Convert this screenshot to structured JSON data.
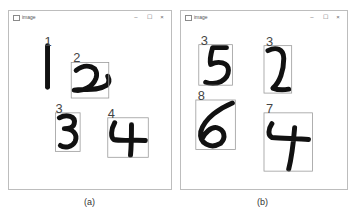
{
  "windows": [
    {
      "id": "a",
      "title": "image",
      "controls": {
        "minimize": "–",
        "maximize": "☐",
        "close": "×"
      },
      "detections": [
        {
          "label": "1",
          "digit": "1"
        },
        {
          "label": "2",
          "digit": "2"
        },
        {
          "label": "3",
          "digit": "3"
        },
        {
          "label": "4",
          "digit": "4"
        }
      ],
      "caption": "(a)"
    },
    {
      "id": "b",
      "title": "image",
      "controls": {
        "minimize": "–",
        "maximize": "☐",
        "close": "×"
      },
      "detections": [
        {
          "label": "3",
          "digit": "5"
        },
        {
          "label": "3",
          "digit": "2"
        },
        {
          "label": "8",
          "digit": "6"
        },
        {
          "label": "7",
          "digit": "4"
        }
      ],
      "caption": "(b)"
    }
  ],
  "colors": {
    "box": "#9a9a9a",
    "ink": "#111111",
    "label": "#444444"
  }
}
